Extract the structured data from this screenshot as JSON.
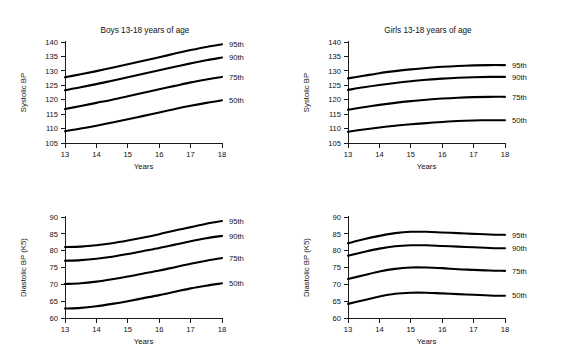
{
  "figure": {
    "background_color": "#ffffff",
    "line_color": "#000000",
    "axis_color": "#1a1a1a"
  },
  "panels": [
    {
      "id": "boys-systolic",
      "title": "Boys 13-18 years of age",
      "xlabel": "Years",
      "ylabel": "Systolic BP"
    },
    {
      "id": "girls-systolic",
      "title": "Girls 13-18 years of age",
      "xlabel": "Years",
      "ylabel": "Systolic BP"
    },
    {
      "id": "boys-diastolic",
      "title": "",
      "xlabel": "Years",
      "ylabel": "Diastolic BP (K5)"
    },
    {
      "id": "girls-diastolic",
      "title": "",
      "xlabel": "Years",
      "ylabel": "Diastolic BP (K5)"
    }
  ],
  "chart_data": [
    {
      "type": "line",
      "id": "boys-systolic",
      "title": "Boys 13-18 years of age",
      "xlabel": "Years",
      "ylabel": "Systolic BP",
      "xlim": [
        13,
        18
      ],
      "ylim": [
        105,
        140
      ],
      "xticks": [
        13,
        14,
        15,
        16,
        17,
        18
      ],
      "yticks": [
        105,
        110,
        115,
        120,
        125,
        130,
        135,
        140
      ],
      "grid": false,
      "legend_position": "right-inline",
      "x": [
        13,
        13.5,
        14,
        14.5,
        15,
        15.5,
        16,
        16.5,
        17,
        17.5,
        18
      ],
      "series": [
        {
          "name": "95th",
          "values": [
            127.8,
            128.8,
            129.9,
            131.1,
            132.3,
            133.5,
            134.7,
            136.0,
            137.2,
            138.3,
            139.2
          ]
        },
        {
          "name": "90th",
          "values": [
            123.3,
            124.3,
            125.4,
            126.6,
            127.8,
            129.0,
            130.2,
            131.4,
            132.6,
            133.7,
            134.6
          ]
        },
        {
          "name": "75th",
          "values": [
            116.8,
            117.8,
            118.9,
            120.0,
            121.2,
            122.4,
            123.6,
            124.8,
            126.0,
            127.0,
            127.9
          ]
        },
        {
          "name": "50th",
          "values": [
            109.1,
            110.0,
            111.0,
            112.1,
            113.2,
            114.4,
            115.6,
            116.8,
            117.9,
            118.9,
            119.8
          ]
        }
      ]
    },
    {
      "type": "line",
      "id": "girls-systolic",
      "title": "Girls 13-18 years of age",
      "xlabel": "Years",
      "ylabel": "Systolic BP",
      "xlim": [
        13,
        18
      ],
      "ylim": [
        105,
        140
      ],
      "xticks": [
        13,
        14,
        15,
        16,
        17,
        18
      ],
      "yticks": [
        105,
        110,
        115,
        120,
        125,
        130,
        135,
        140
      ],
      "grid": false,
      "legend_position": "right-inline",
      "x": [
        13,
        13.5,
        14,
        14.5,
        15,
        15.5,
        16,
        16.5,
        17,
        17.5,
        18
      ],
      "series": [
        {
          "name": "95th",
          "values": [
            127.4,
            128.3,
            129.2,
            129.9,
            130.5,
            131.0,
            131.4,
            131.7,
            131.9,
            132.0,
            132.0
          ]
        },
        {
          "name": "90th",
          "values": [
            123.4,
            124.3,
            125.1,
            125.8,
            126.4,
            126.9,
            127.3,
            127.6,
            127.8,
            127.9,
            127.9
          ]
        },
        {
          "name": "75th",
          "values": [
            116.5,
            117.4,
            118.2,
            118.9,
            119.5,
            120.0,
            120.4,
            120.7,
            120.9,
            121.0,
            121.0
          ]
        },
        {
          "name": "50th",
          "values": [
            108.9,
            109.7,
            110.4,
            111.0,
            111.5,
            111.9,
            112.3,
            112.6,
            112.8,
            112.9,
            112.9
          ]
        }
      ]
    },
    {
      "type": "line",
      "id": "boys-diastolic",
      "title": "",
      "xlabel": "Years",
      "ylabel": "Diastolic BP (K5)",
      "xlim": [
        13,
        18
      ],
      "ylim": [
        60,
        90
      ],
      "xticks": [
        13,
        14,
        15,
        16,
        17,
        18
      ],
      "yticks": [
        60,
        65,
        70,
        75,
        80,
        85,
        90
      ],
      "grid": false,
      "legend_position": "right-inline",
      "x": [
        13,
        13.5,
        14,
        14.5,
        15,
        15.5,
        16,
        16.5,
        17,
        17.5,
        18
      ],
      "series": [
        {
          "name": "95th",
          "values": [
            81.1,
            81.2,
            81.6,
            82.2,
            83.0,
            83.9,
            84.9,
            86.0,
            87.0,
            88.0,
            88.8
          ]
        },
        {
          "name": "90th",
          "values": [
            77.0,
            77.2,
            77.6,
            78.2,
            79.0,
            79.9,
            80.8,
            81.8,
            82.8,
            83.7,
            84.4
          ]
        },
        {
          "name": "75th",
          "values": [
            70.1,
            70.3,
            70.8,
            71.5,
            72.3,
            73.2,
            74.1,
            75.1,
            76.1,
            77.0,
            77.8
          ]
        },
        {
          "name": "50th",
          "values": [
            62.8,
            63.0,
            63.5,
            64.2,
            65.0,
            65.9,
            66.8,
            67.8,
            68.8,
            69.6,
            70.3
          ]
        }
      ]
    },
    {
      "type": "line",
      "id": "girls-diastolic",
      "title": "",
      "xlabel": "Years",
      "ylabel": "Diastolic BP (K5)",
      "xlim": [
        13,
        18
      ],
      "ylim": [
        60,
        90
      ],
      "xticks": [
        13,
        14,
        15,
        16,
        17,
        18
      ],
      "yticks": [
        60,
        65,
        70,
        75,
        80,
        85,
        90
      ],
      "grid": false,
      "legend_position": "right-inline",
      "x": [
        13,
        13.5,
        14,
        14.5,
        15,
        15.5,
        16,
        16.5,
        17,
        17.5,
        18
      ],
      "series": [
        {
          "name": "95th",
          "values": [
            82.2,
            83.4,
            84.4,
            85.2,
            85.6,
            85.6,
            85.4,
            85.2,
            85.0,
            84.8,
            84.7
          ]
        },
        {
          "name": "90th",
          "values": [
            78.5,
            79.6,
            80.6,
            81.3,
            81.6,
            81.6,
            81.4,
            81.2,
            81.0,
            80.8,
            80.7
          ]
        },
        {
          "name": "75th",
          "values": [
            71.6,
            72.7,
            73.8,
            74.6,
            75.0,
            75.0,
            74.8,
            74.5,
            74.3,
            74.1,
            74.0
          ]
        },
        {
          "name": "50th",
          "values": [
            64.2,
            65.3,
            66.4,
            67.2,
            67.5,
            67.5,
            67.3,
            67.1,
            66.9,
            66.7,
            66.6
          ]
        }
      ]
    }
  ]
}
